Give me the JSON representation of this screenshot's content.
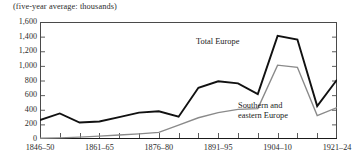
{
  "figure": {
    "caption": "(five-year average: thousands)"
  },
  "chart_data": {
    "type": "line",
    "title": "(five-year average: thousands)",
    "xlabel": "",
    "ylabel": "",
    "ylim": [
      0,
      1600
    ],
    "yticks": [
      "0",
      "200",
      "400",
      "600",
      "800",
      "1,000",
      "1,200",
      "1,400",
      "1,600"
    ],
    "ytick_values": [
      0,
      200,
      400,
      600,
      800,
      1000,
      1200,
      1400,
      1600
    ],
    "grid": false,
    "legend_position": "inline-annotation",
    "x_tick_count": 16,
    "xtick_labels": [
      "1846–50",
      "1861–65",
      "1876–80",
      "1891–95",
      "1904–10",
      "1921–24"
    ],
    "xtick_label_indices": [
      0,
      3,
      6,
      9,
      12,
      15
    ],
    "x_periods": [
      "1846-50",
      "1851-55",
      "1856-60",
      "1861-65",
      "1866-70",
      "1871-75",
      "1876-80",
      "1881-85",
      "1886-90",
      "1891-95",
      "1896-1900",
      "1901-03",
      "1904-10",
      "1911-15",
      "1916-20",
      "1921-24"
    ],
    "series": [
      {
        "name": "Total Europe",
        "color": "#111111",
        "width": 1.9,
        "values": [
          260,
          350,
          225,
          240,
          300,
          360,
          380,
          305,
          700,
          790,
          760,
          615,
          1410,
          1360,
          450,
          810
        ]
      },
      {
        "name": "Southern and eastern Europe",
        "color": "#8a8a8a",
        "width": 1.4,
        "values": [
          10,
          15,
          25,
          40,
          55,
          70,
          90,
          190,
          290,
          360,
          405,
          415,
          1010,
          980,
          320,
          430
        ]
      }
    ],
    "annotations": [
      {
        "text": "Total Europe",
        "series": "Total Europe"
      },
      {
        "text": "Southern and",
        "series": "Southern and eastern Europe"
      },
      {
        "text": "eastern Europe",
        "series": "Southern and eastern Europe"
      }
    ]
  },
  "labels": {
    "total_europe": "Total Europe",
    "southern_line1": "Southern and",
    "southern_line2": "eastern Europe"
  }
}
